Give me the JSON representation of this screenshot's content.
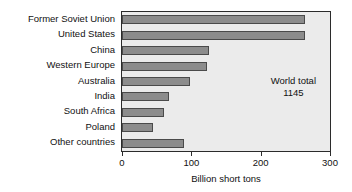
{
  "chart_data": {
    "type": "bar",
    "orientation": "horizontal",
    "title": "",
    "xlabel": "Billion short tons",
    "ylabel": "",
    "xlim": [
      0,
      300
    ],
    "xticks": [
      0,
      100,
      200,
      300
    ],
    "xtick_labels": [
      "0",
      "100",
      "200",
      "300"
    ],
    "grid": false,
    "legend": null,
    "categories": [
      "Former Soviet Union",
      "United States",
      "China",
      "Western Europe",
      "Australia",
      "India",
      "South Africa",
      "Poland",
      "Other countries"
    ],
    "values": [
      264,
      264,
      125,
      123,
      98,
      68,
      60,
      45,
      89
    ],
    "annotations": [
      {
        "line1": "World total",
        "line2": "1145",
        "position": "upper-right"
      }
    ],
    "colors": {
      "bar_fill": "#8c8c8c",
      "bar_border": "#4a4a4a",
      "plot_background": "#ebebeb",
      "plot_border": "#2b2b2b",
      "text": "#111111",
      "page_background": "#ffffff"
    }
  }
}
